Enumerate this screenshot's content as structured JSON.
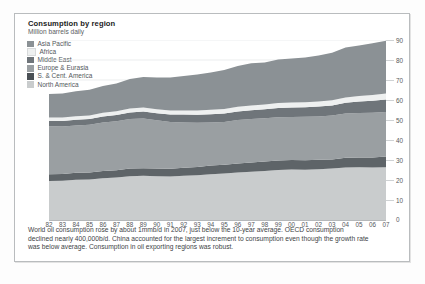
{
  "chart_data": {
    "type": "area",
    "stacked": true,
    "title": "Consumption by region",
    "subtitle": "Million barrels daily",
    "xlabel": "",
    "ylabel": "Million barrels daily",
    "ylim": [
      0,
      90
    ],
    "ytick_values": [
      0,
      10,
      20,
      30,
      40,
      50,
      60,
      70,
      80,
      90
    ],
    "grid": true,
    "legend_position": "top-left",
    "x": [
      "82",
      "83",
      "84",
      "85",
      "86",
      "87",
      "88",
      "89",
      "90",
      "91",
      "92",
      "93",
      "94",
      "95",
      "96",
      "97",
      "98",
      "99",
      "00",
      "01",
      "02",
      "03",
      "04",
      "05",
      "06",
      "07"
    ],
    "categories": [
      "1982",
      "1983",
      "1984",
      "1985",
      "1986",
      "1987",
      "1988",
      "1989",
      "1990",
      "1991",
      "1992",
      "1993",
      "1994",
      "1995",
      "1996",
      "1997",
      "1998",
      "1999",
      "2000",
      "2001",
      "2002",
      "2003",
      "2004",
      "2005",
      "2006",
      "2007"
    ],
    "series": [
      {
        "name": "North America",
        "color": "#c9cccd",
        "values": [
          19.5,
          19.6,
          20.1,
          20.3,
          20.9,
          21.2,
          21.9,
          22.1,
          21.9,
          21.7,
          22.1,
          22.4,
          22.9,
          23.2,
          23.8,
          24.1,
          24.5,
          25.0,
          25.2,
          25.1,
          25.4,
          25.7,
          26.3,
          26.4,
          26.2,
          26.4
        ]
      },
      {
        "name": "S. & Cent. America",
        "color": "#5e6468",
        "values": [
          3.4,
          3.4,
          3.5,
          3.5,
          3.6,
          3.7,
          3.8,
          3.8,
          3.8,
          3.9,
          4.0,
          4.1,
          4.3,
          4.4,
          4.5,
          4.7,
          4.8,
          4.8,
          4.8,
          4.8,
          4.7,
          4.6,
          4.8,
          4.9,
          5.1,
          5.4
        ]
      },
      {
        "name": "Europe & Eurasia",
        "color": "#9a9fa2",
        "values": [
          24.0,
          23.8,
          23.7,
          23.8,
          24.2,
          24.5,
          24.8,
          24.9,
          24.2,
          23.4,
          22.7,
          22.1,
          21.6,
          21.4,
          21.7,
          21.7,
          21.6,
          21.6,
          21.5,
          21.7,
          21.7,
          21.9,
          22.1,
          22.2,
          22.3,
          22.2
        ]
      },
      {
        "name": "Middle East",
        "color": "#6f757a"
      },
      {
        "name": "Africa",
        "color": "#eef0f0"
      },
      {
        "name": "Asia Pacific",
        "color": "#8b9195"
      }
    ],
    "series_values_extra": {
      "Middle East": [
        2.6,
        2.7,
        2.8,
        2.9,
        3.0,
        3.1,
        3.3,
        3.4,
        3.5,
        3.7,
        3.9,
        4.0,
        4.1,
        4.2,
        4.3,
        4.4,
        4.5,
        4.6,
        4.7,
        4.8,
        4.9,
        5.1,
        5.4,
        5.7,
        6.0,
        6.2
      ],
      "Africa": [
        1.7,
        1.7,
        1.8,
        1.8,
        1.9,
        1.9,
        2.0,
        2.0,
        2.0,
        2.1,
        2.1,
        2.2,
        2.2,
        2.3,
        2.3,
        2.4,
        2.4,
        2.5,
        2.5,
        2.5,
        2.6,
        2.6,
        2.7,
        2.8,
        2.9,
        3.0
      ],
      "Asia Pacific": [
        11.8,
        12.0,
        12.5,
        12.8,
        13.4,
        13.9,
        14.7,
        15.3,
        15.9,
        16.5,
        17.2,
        17.9,
        18.7,
        19.5,
        20.4,
        21.1,
        20.9,
        21.7,
        22.0,
        22.3,
        22.9,
        23.7,
        25.0,
        25.3,
        25.9,
        26.4
      ]
    },
    "totals": [
      63.0,
      63.2,
      64.4,
      65.1,
      67.0,
      68.3,
      70.5,
      71.5,
      71.3,
      71.3,
      72.0,
      72.7,
      73.8,
      75.0,
      77.0,
      78.4,
      78.7,
      80.2,
      80.7,
      81.2,
      82.2,
      83.6,
      86.3,
      87.3,
      88.4,
      89.6
    ],
    "legend": [
      {
        "label": "Asia Pacific",
        "color": "#8b9195"
      },
      {
        "label": "Africa",
        "color": "#eef0f0"
      },
      {
        "label": "Middle East",
        "color": "#6f757a"
      },
      {
        "label": "Europe & Eurasia",
        "color": "#9a9fa2"
      },
      {
        "label": "S. & Cent. America",
        "color": "#4a5055"
      },
      {
        "label": "North America",
        "color": "#c9cccd"
      }
    ]
  },
  "caption": {
    "line1": "World oil consumption rose by about 1mmb/d in 2007, just below the 10-year average. OECD consumption",
    "line2": "declined nearly 400,000b/d. China accounted for the largest increment to consumption even though the growth rate",
    "line3": "was below average. Consumption in oil exporting regions was robust."
  }
}
